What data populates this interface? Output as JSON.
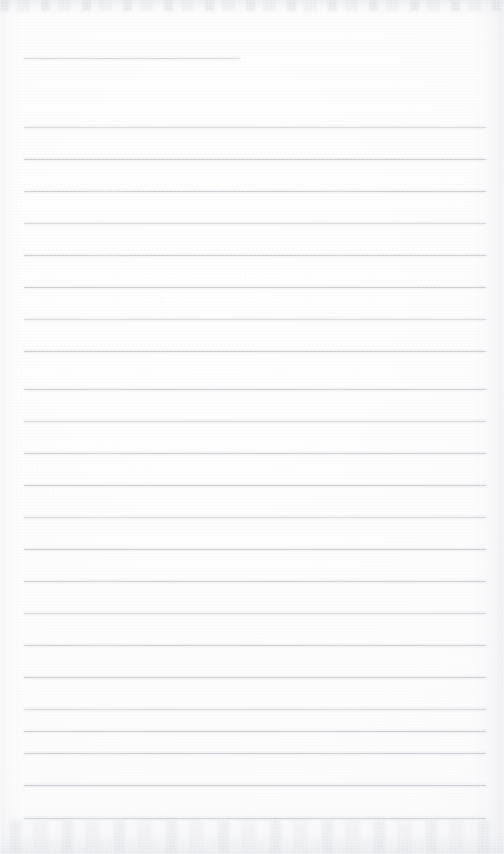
{
  "document": {
    "kind": "scanned-lined-notepad-page",
    "page_width": 504,
    "page_height": 854,
    "background_color": "#fdfdfd",
    "rule_color": "#c7c9ce",
    "content_text": "",
    "handwriting_present": "false",
    "printed_text_present": "false"
  },
  "ruling": {
    "left_margin_x": 24,
    "right_margin_x": 486,
    "line_spacing_px": 32,
    "first_ruled_line_y": 127,
    "last_ruled_line_y": 818,
    "ruled_line_count": 23,
    "line_thickness_px": 1
  },
  "top_short_rule": {
    "label": "short-rule",
    "y": 58,
    "x_start": 24,
    "x_end": 240,
    "length_px": 216
  },
  "rules": [
    {
      "y": 127,
      "x_start": 24,
      "x_end": 486,
      "faded": "true"
    },
    {
      "y": 159,
      "x_start": 24,
      "x_end": 486,
      "faded": "false"
    },
    {
      "y": 191,
      "x_start": 24,
      "x_end": 486,
      "faded": "true"
    },
    {
      "y": 223,
      "x_start": 24,
      "x_end": 486,
      "faded": "false"
    },
    {
      "y": 255,
      "x_start": 24,
      "x_end": 486,
      "faded": "true"
    },
    {
      "y": 287,
      "x_start": 24,
      "x_end": 486,
      "faded": "false"
    },
    {
      "y": 319,
      "x_start": 24,
      "x_end": 486,
      "faded": "true"
    },
    {
      "y": 351,
      "x_start": 24,
      "x_end": 486,
      "faded": "false"
    },
    {
      "y": 389,
      "x_start": 24,
      "x_end": 486,
      "faded": "true"
    },
    {
      "y": 421,
      "x_start": 24,
      "x_end": 486,
      "faded": "false"
    },
    {
      "y": 453,
      "x_start": 24,
      "x_end": 486,
      "faded": "true"
    },
    {
      "y": 485,
      "x_start": 24,
      "x_end": 486,
      "faded": "false"
    },
    {
      "y": 517,
      "x_start": 24,
      "x_end": 486,
      "faded": "true"
    },
    {
      "y": 549,
      "x_start": 24,
      "x_end": 486,
      "faded": "false"
    },
    {
      "y": 581,
      "x_start": 24,
      "x_end": 486,
      "faded": "true"
    },
    {
      "y": 613,
      "x_start": 24,
      "x_end": 486,
      "faded": "false"
    },
    {
      "y": 645,
      "x_start": 24,
      "x_end": 486,
      "faded": "true"
    },
    {
      "y": 677,
      "x_start": 24,
      "x_end": 486,
      "faded": "false"
    },
    {
      "y": 709,
      "x_start": 24,
      "x_end": 486,
      "faded": "true"
    },
    {
      "y": 731,
      "x_start": 24,
      "x_end": 486,
      "faded": "false"
    },
    {
      "y": 753,
      "x_start": 24,
      "x_end": 486,
      "faded": "true"
    },
    {
      "y": 785,
      "x_start": 24,
      "x_end": 486,
      "faded": "false"
    },
    {
      "y": 818,
      "x_start": 24,
      "x_end": 486,
      "faded": "true"
    }
  ],
  "artifacts": {
    "top_band_label": "scan-edge-smudge",
    "bottom_band_label": "page-bottom-shadow",
    "right_band_label": "page-right-edge-shadow",
    "left_band_label": "page-left-edge-shadow",
    "grain_label": "scan-grain"
  }
}
